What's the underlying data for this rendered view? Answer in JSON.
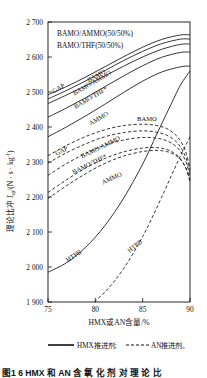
{
  "figure": {
    "caption": "图1  6   HMX 和 AN 含 氧 化 剂 对 理 论 比",
    "plot_box_labels": [
      "BAMO/AMMO(50/50%)",
      "BAMO/THF(50/50%)"
    ]
  },
  "legend": {
    "items": [
      {
        "label": "HMX推进剂;",
        "style": "solid",
        "name": "hmx-propellant"
      },
      {
        "label": "AN推进剂。",
        "style": "dashed",
        "name": "an-propellant"
      }
    ]
  },
  "chart_data": {
    "type": "line",
    "title": "",
    "xlabel": "HMX或AN含量/%",
    "ylabel": "理论比冲 Isp/(N · s · kg-1)",
    "ylabel_parts": {
      "prefix": "理论比冲 ",
      "symbol": "I",
      "subscript": "sp",
      "units": "/(N · s · kg",
      "superscript": "-1",
      "suffix": ")"
    },
    "xlim": [
      75,
      90
    ],
    "ylim": [
      1900,
      2700
    ],
    "xticks": [
      75,
      80,
      85,
      90
    ],
    "xtick_labels": [
      "75",
      "80",
      "85",
      "90"
    ],
    "yticks": [
      1900,
      2000,
      2100,
      2200,
      2300,
      2400,
      2500,
      2600,
      2700
    ],
    "ytick_labels": [
      "1 900",
      "2 000",
      "2 100",
      "2 200",
      "2 300",
      "2 400",
      "2 500",
      "2 600",
      "2 700"
    ],
    "grid": false,
    "legend_position": "below-axis",
    "series": [
      {
        "name": "BAMO (HMX)",
        "label": "BAMO",
        "style": "solid",
        "group": "HMX推进剂",
        "label_pos": {
          "x": 79.3,
          "y": 2527
        },
        "label_rot": -30,
        "x": [
          75,
          77,
          79,
          81,
          83,
          85,
          87,
          89,
          90
        ],
        "y": [
          2492,
          2516,
          2543,
          2572,
          2601,
          2628,
          2650,
          2663,
          2663
        ]
      },
      {
        "name": "GAP (HMX)",
        "label": "GAP",
        "style": "solid",
        "group": "HMX推进剂",
        "label_pos": {
          "x": 75.6,
          "y": 2496
        },
        "label_rot": -30,
        "x": [
          75,
          77,
          79,
          81,
          83,
          85,
          87,
          89,
          90
        ],
        "y": [
          2480,
          2505,
          2532,
          2561,
          2590,
          2616,
          2638,
          2651,
          2651
        ]
      },
      {
        "name": "BAMO/AMMO (HMX)",
        "label": "BAMO/AMMO",
        "style": "solid",
        "group": "HMX推进剂",
        "label_pos": {
          "x": 77.8,
          "y": 2490
        },
        "label_rot": -30,
        "x": [
          75,
          77,
          79,
          81,
          83,
          85,
          87,
          89,
          90
        ],
        "y": [
          2467,
          2492,
          2518,
          2546,
          2574,
          2600,
          2622,
          2636,
          2637
        ]
      },
      {
        "name": "BAMO/THF (HMX)",
        "label": "BAMO/THF*",
        "style": "solid",
        "group": "HMX推进剂",
        "label_pos": {
          "x": 77.9,
          "y": 2452
        },
        "label_rot": -30,
        "x": [
          75,
          77,
          79,
          81,
          83,
          85,
          87,
          89,
          90
        ],
        "y": [
          2428,
          2455,
          2484,
          2515,
          2546,
          2575,
          2599,
          2613,
          2614
        ]
      },
      {
        "name": "AMMO (HMX)",
        "label": "AMMO",
        "style": "solid",
        "group": "HMX推进剂",
        "label_pos": {
          "x": 79.5,
          "y": 2404
        },
        "label_rot": -30,
        "x": [
          75,
          77,
          79,
          81,
          83,
          85,
          87,
          89,
          90
        ],
        "y": [
          2372,
          2401,
          2432,
          2465,
          2499,
          2531,
          2557,
          2572,
          2574
        ]
      },
      {
        "name": "HTPB (HMX)",
        "label": "HTPB",
        "style": "solid",
        "group": "HMX推进剂",
        "label_pos": {
          "x": 77.1,
          "y": 2013
        },
        "label_rot": -34,
        "x": [
          75,
          77,
          79,
          81,
          83,
          85,
          86.5,
          88,
          89,
          90
        ],
        "y": [
          1985,
          2013,
          2057,
          2118,
          2197,
          2294,
          2380,
          2465,
          2520,
          2560
        ]
      },
      {
        "name": "BAMO (AN)",
        "label": "BAMO",
        "style": "dashed",
        "group": "AN推进剂",
        "label_pos": {
          "x": 84.4,
          "y": 2418
        },
        "label_rot": 0,
        "x": [
          75,
          77,
          79,
          81,
          83,
          85,
          86.5,
          87.5,
          88.3,
          89,
          89.6,
          90
        ],
        "y": [
          2318,
          2348,
          2373,
          2392,
          2404,
          2408,
          2404,
          2396,
          2382,
          2360,
          2325,
          2280
        ]
      },
      {
        "name": "GAP (AN)",
        "label": "GAP",
        "style": "dashed",
        "group": "AN推进剂",
        "label_pos": {
          "x": 75.9,
          "y": 2318
        },
        "label_rot": -26,
        "x": [
          75,
          77,
          79,
          81,
          83,
          85,
          86.5,
          87.5,
          88.3,
          89,
          89.6,
          90
        ],
        "y": [
          2297,
          2327,
          2352,
          2372,
          2384,
          2389,
          2385,
          2377,
          2364,
          2343,
          2310,
          2268
        ]
      },
      {
        "name": "BAMO/AMMO (AN)",
        "label": "BAMO/AMMO",
        "style": "dashed",
        "group": "AN推进剂",
        "label_pos": {
          "x": 78.6,
          "y": 2310
        },
        "label_rot": -26,
        "x": [
          75,
          77,
          79,
          81,
          83,
          85,
          86.5,
          87.5,
          88.3,
          89,
          89.6,
          90
        ],
        "y": [
          2262,
          2296,
          2325,
          2348,
          2363,
          2370,
          2368,
          2361,
          2349,
          2330,
          2298,
          2258
        ]
      },
      {
        "name": "BAMO/THF (AN)",
        "label": "BAMO/THF*",
        "style": "dashed",
        "group": "AN推进剂",
        "label_pos": {
          "x": 77.7,
          "y": 2265
        },
        "label_rot": -26,
        "x": [
          75,
          77,
          79,
          81,
          83,
          85,
          86.5,
          87.5,
          88.3,
          89,
          89.6,
          90
        ],
        "y": [
          2213,
          2250,
          2283,
          2310,
          2329,
          2340,
          2341,
          2336,
          2326,
          2309,
          2280,
          2244
        ]
      },
      {
        "name": "AMMO (AN)",
        "label": "AMMO",
        "style": "dashed",
        "group": "AN推进剂",
        "label_pos": {
          "x": 80.8,
          "y": 2236
        },
        "label_rot": -24,
        "x": [
          75,
          77,
          79,
          81,
          83,
          85,
          86.5,
          87.5,
          88.3,
          89,
          89.6,
          90
        ],
        "y": [
          2196,
          2233,
          2267,
          2296,
          2317,
          2330,
          2333,
          2330,
          2322,
          2307,
          2281,
          2248
        ]
      },
      {
        "name": "HTPB (AN)",
        "label": "HTPB",
        "style": "dashed",
        "group": "AN推进剂",
        "label_pos": {
          "x": 83.6,
          "y": 2040
        },
        "label_rot": -38,
        "x": [
          79.9,
          81,
          82,
          83,
          84,
          85,
          86,
          87,
          88,
          89,
          90
        ],
        "y": [
          1900,
          1928,
          1959,
          1996,
          2039,
          2087,
          2141,
          2199,
          2259,
          2318,
          2372
        ]
      }
    ]
  }
}
